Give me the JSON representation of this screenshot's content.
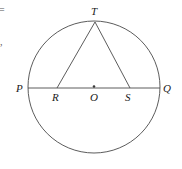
{
  "figure": {
    "kind": "circle-geometry-diagram",
    "width": 182,
    "height": 169,
    "background_color": "#ffffff",
    "stroke_color": "#4a4a4a",
    "label_color": "#1a1a1a"
  },
  "labels": {
    "p": "P",
    "q": "Q",
    "r": "R",
    "s": "S",
    "t": "T",
    "o": "O"
  },
  "margin_fragments": {
    "equals": "=",
    "comma": ","
  },
  "geometry": {
    "circle": {
      "center_x": 94,
      "center_y": 87,
      "radius": 66
    },
    "points": {
      "P": {
        "x": 28,
        "y": 88
      },
      "Q": {
        "x": 160,
        "y": 88
      },
      "O": {
        "x": 94,
        "y": 88
      },
      "R": {
        "x": 57,
        "y": 88
      },
      "S": {
        "x": 130,
        "y": 88
      },
      "T": {
        "x": 95,
        "y": 22
      }
    },
    "segments": [
      {
        "name": "diameter-PQ",
        "from": "P",
        "to": "Q"
      },
      {
        "name": "chord-TR",
        "from": "T",
        "to": "R"
      },
      {
        "name": "chord-TS",
        "from": "T",
        "to": "S"
      }
    ],
    "center_dot_radius": 1.2
  }
}
